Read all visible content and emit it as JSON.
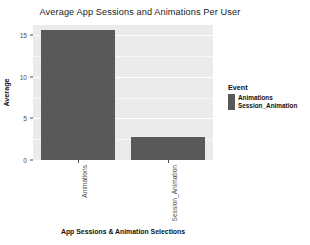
{
  "chart_data": {
    "type": "bar",
    "title": "Average App Sessions and Animations Per User",
    "xlabel": "App Sessions & Animation Selections",
    "ylabel": "Average",
    "categories": [
      "Animations",
      "Session_Animation"
    ],
    "values": [
      15.6,
      2.75
    ],
    "series": [
      {
        "name": "Average",
        "values": [
          15.6,
          2.75
        ]
      }
    ],
    "ylim": [
      0,
      16.2
    ],
    "yticks": [
      0,
      5,
      10,
      15
    ],
    "ytick_labels": [
      "0",
      "5",
      "10",
      "15"
    ],
    "xtick_labels": [
      "Animations",
      "Session_Animation"
    ],
    "grid": true,
    "grid_color": "#ffffff",
    "panel_background": "#ebebeb",
    "bar_color": "#595959",
    "legend": {
      "position": "right",
      "title": "Event",
      "entries": [
        {
          "label": "Animations",
          "color": "#595959"
        },
        {
          "label": "Session_Animation",
          "color": "#595959"
        }
      ]
    }
  },
  "legend": {
    "title": "Event",
    "items": [
      {
        "label": "Animations",
        "color": "#595959"
      },
      {
        "label": "Session_Animation",
        "color": "#595959"
      }
    ]
  },
  "axes": {
    "y_title": "Average",
    "x_title": "App Sessions & Animation Selections",
    "y_ticks": [
      "15",
      "10",
      "5",
      "0"
    ],
    "x_ticks": [
      "Animations",
      "Session_Animation"
    ]
  },
  "title": "Average App Sessions and Animations Per User"
}
